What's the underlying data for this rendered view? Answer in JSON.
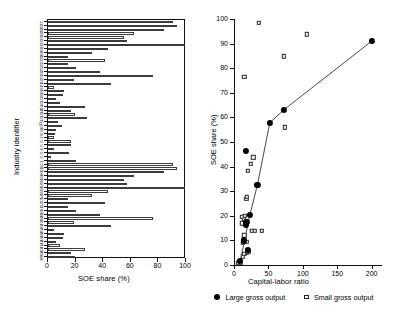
{
  "chart_data": [
    {
      "type": "bar",
      "orientation": "horizontal",
      "title": "",
      "xlabel": "SOE share (%)",
      "ylabel": "Industry identifier",
      "xlim": [
        0,
        100
      ],
      "xticks": [
        0,
        20,
        40,
        60,
        80,
        100
      ],
      "grid": false,
      "sorted": "descending",
      "categories": [
        "37",
        "36",
        "35",
        "34",
        "33",
        "32",
        "31",
        "30",
        "29",
        "28",
        "27",
        "26",
        "25",
        "24",
        "23",
        "22",
        "21",
        "20",
        "19",
        "18",
        "17",
        "16",
        "15",
        "14",
        "13",
        "12",
        "11",
        "10",
        "9",
        "8",
        "7",
        "6",
        "5",
        "4",
        "3",
        "2",
        "1",
        "62",
        "61",
        "60",
        "59",
        "58",
        "57",
        "56",
        "55",
        "54",
        "53",
        "52",
        "51",
        "50",
        "49",
        "48",
        "47",
        "46",
        "45",
        "44",
        "43",
        "42",
        "41",
        "40",
        "39",
        "38"
      ],
      "values": [
        90.5,
        93.5,
        84.0,
        62.0,
        55.0,
        57.5,
        99.5,
        43.5,
        32.0,
        14.5,
        41.0,
        14.5,
        20.5,
        38.0,
        76.0,
        18.5,
        46.0,
        4.5,
        11.5,
        11.0,
        5.5,
        9.0,
        27.0,
        16.5,
        19.5,
        28.5,
        7.0,
        10.5,
        6.0,
        5.0,
        4.0,
        16.5,
        16.5,
        4.0,
        15.0,
        2.5,
        20.0,
        90.5,
        93.5,
        84.0,
        62.0,
        55.0,
        57.5,
        99.5,
        43.5,
        32.0,
        14.5,
        41.0,
        14.5,
        20.5,
        38.0,
        76.0,
        18.5,
        46.0,
        4.5,
        11.5,
        11.0,
        5.5,
        9.0,
        27.0,
        16.5,
        19.5
      ]
    },
    {
      "type": "scatter",
      "title": "",
      "xlabel": "Capital-labor ratio",
      "ylabel": "SOE share (%)",
      "xlim": [
        0,
        215
      ],
      "ylim": [
        0,
        100
      ],
      "xticks": [
        0,
        50,
        100,
        150,
        200
      ],
      "yticks": [
        0,
        10,
        20,
        30,
        40,
        50,
        60,
        70,
        80,
        90,
        100
      ],
      "grid": false,
      "legend_position": "below",
      "series": [
        {
          "name": "Large gross output",
          "marker": "filled-circle",
          "color": "#000000",
          "connected_by_line": true,
          "points": [
            {
              "x": 9,
              "y": 1.5
            },
            {
              "x": 14,
              "y": 10.0
            },
            {
              "x": 17,
              "y": 16.5
            },
            {
              "x": 18,
              "y": 17.5
            },
            {
              "x": 20,
              "y": 6.0
            },
            {
              "x": 23,
              "y": 20.3
            },
            {
              "x": 17,
              "y": 46.3
            },
            {
              "x": 34,
              "y": 32.5
            },
            {
              "x": 52,
              "y": 57.8
            },
            {
              "x": 72,
              "y": 63.0
            },
            {
              "x": 200,
              "y": 91.0
            }
          ]
        },
        {
          "name": "Small gross output",
          "marker": "open-square",
          "color": "#222222",
          "connected_by_line": false,
          "points": [
            {
              "x": 6,
              "y": 0.8
            },
            {
              "x": 9,
              "y": 1.0
            },
            {
              "x": 13,
              "y": 3.5
            },
            {
              "x": 15,
              "y": 4.5
            },
            {
              "x": 19,
              "y": 5.0
            },
            {
              "x": 21,
              "y": 5.5
            },
            {
              "x": 13,
              "y": 9.0
            },
            {
              "x": 18,
              "y": 9.5
            },
            {
              "x": 15,
              "y": 12.0
            },
            {
              "x": 26,
              "y": 14.0
            },
            {
              "x": 30,
              "y": 14.0
            },
            {
              "x": 40,
              "y": 14.0
            },
            {
              "x": 12,
              "y": 17.0
            },
            {
              "x": 14,
              "y": 18.5
            },
            {
              "x": 11,
              "y": 19.5
            },
            {
              "x": 16,
              "y": 20.0
            },
            {
              "x": 18,
              "y": 27.0
            },
            {
              "x": 19,
              "y": 27.8
            },
            {
              "x": 20,
              "y": 38.2
            },
            {
              "x": 24,
              "y": 41.2
            },
            {
              "x": 28,
              "y": 43.8
            },
            {
              "x": 74,
              "y": 56.0
            },
            {
              "x": 15,
              "y": 76.5
            },
            {
              "x": 72,
              "y": 84.8
            },
            {
              "x": 106,
              "y": 93.8
            },
            {
              "x": 36,
              "y": 98.5
            }
          ]
        }
      ],
      "trend_line": {
        "name": "connecting-line",
        "points": [
          {
            "x": 9,
            "y": 1.5
          },
          {
            "x": 23,
            "y": 20.3
          },
          {
            "x": 34,
            "y": 32.5
          },
          {
            "x": 52,
            "y": 57.8
          },
          {
            "x": 72,
            "y": 63.0
          },
          {
            "x": 200,
            "y": 91.0
          }
        ]
      }
    }
  ],
  "bar_panel": {
    "xlabel": "SOE share (%)",
    "ylabel": "Industry identifier",
    "xticklabels": [
      "0",
      "20",
      "40",
      "60",
      "80",
      "100"
    ]
  },
  "scatter_panel": {
    "xlabel": "Capital-labor ratio",
    "ylabel": "SOE share (%)",
    "xticklabels": [
      "0",
      "50",
      "100",
      "150",
      "200"
    ],
    "yticklabels": [
      "0",
      "10",
      "20",
      "30",
      "40",
      "50",
      "60",
      "70",
      "80",
      "90",
      "100"
    ]
  },
  "legend": {
    "large_label": "Large gross output",
    "small_label": "Small gross output"
  }
}
